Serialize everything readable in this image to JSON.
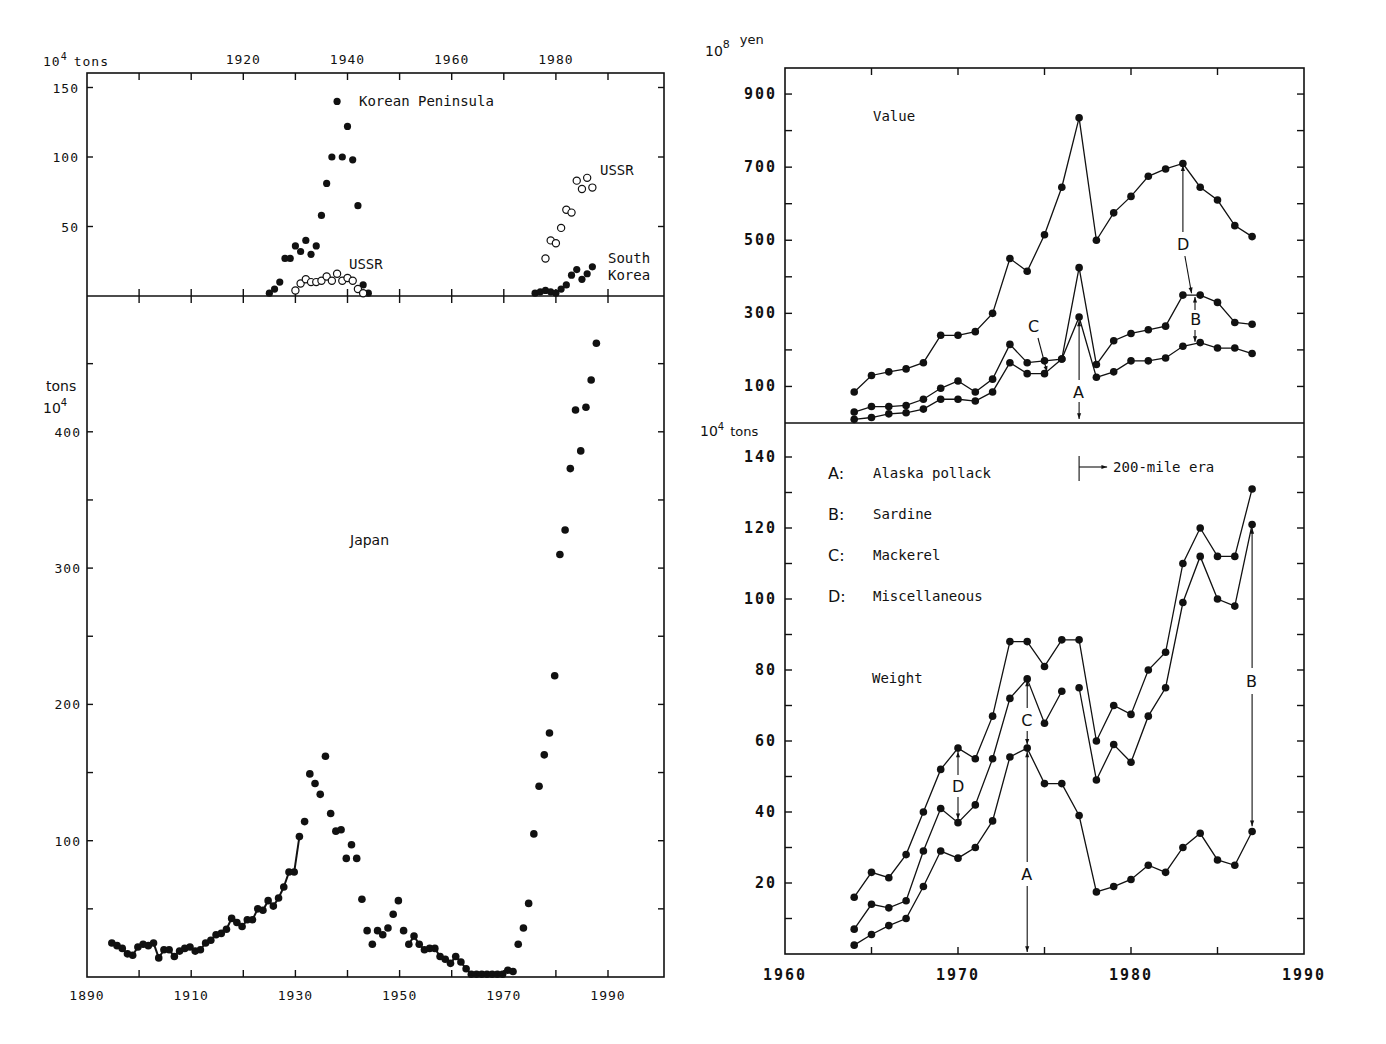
{
  "chart_data": [
    {
      "id": "left-top",
      "type": "scatter",
      "title": "",
      "xlabel": "",
      "ylabel": "10^4 tons",
      "ylabel_base": "10",
      "ylabel_exp": "4",
      "ylabel_unit": "tons",
      "xlim": [
        1890,
        2000
      ],
      "ylim": [
        0,
        160
      ],
      "x_ticks_labeled": [
        1920,
        1940,
        1960,
        1980
      ],
      "x_ticks": [
        1900,
        1910,
        1920,
        1930,
        1940,
        1950,
        1960,
        1970,
        1980,
        1990
      ],
      "y_ticks": [
        50,
        100,
        150
      ],
      "annotations": [
        "Korean Peninsula",
        "USSR",
        "USSR",
        "South Korea"
      ],
      "series": [
        {
          "name": "Korean Peninsula",
          "marker": "filled",
          "x": [
            1925,
            1926,
            1927,
            1928,
            1929,
            1930,
            1931,
            1932,
            1933,
            1934,
            1935,
            1936,
            1937,
            1938,
            1939,
            1940,
            1941,
            1942,
            1943,
            1944
          ],
          "y": [
            2,
            5,
            10,
            27,
            27,
            36,
            32,
            40,
            30,
            36,
            58,
            81,
            100,
            140,
            100,
            122,
            98,
            65,
            8,
            2
          ]
        },
        {
          "name": "USSR (prewar)",
          "marker": "open",
          "x": [
            1930,
            1931,
            1932,
            1933,
            1934,
            1935,
            1936,
            1937,
            1938,
            1939,
            1940,
            1941,
            1942,
            1943
          ],
          "y": [
            4,
            9,
            12,
            10,
            10,
            11,
            14,
            11,
            16,
            11,
            13,
            11,
            5,
            2
          ]
        },
        {
          "name": "USSR",
          "marker": "open",
          "x": [
            1978,
            1979,
            1980,
            1981,
            1982,
            1983,
            1984,
            1985,
            1986,
            1987
          ],
          "y": [
            27,
            40,
            38,
            49,
            62,
            60,
            83,
            77,
            85,
            78
          ]
        },
        {
          "name": "South Korea",
          "marker": "filled",
          "x": [
            1976,
            1977,
            1978,
            1979,
            1980,
            1981,
            1982,
            1983,
            1984,
            1985,
            1986,
            1987
          ],
          "y": [
            2,
            3,
            4,
            3,
            2,
            5,
            8,
            15,
            19,
            12,
            16,
            21
          ]
        }
      ],
      "labels": {
        "korean": "Korean Peninsula",
        "ussr1": "USSR",
        "ussr2": "USSR",
        "south1": "South",
        "south2": "Korea"
      }
    },
    {
      "id": "left-bottom",
      "type": "scatter",
      "title": "Japan",
      "xlabel": "",
      "ylabel": "10^4 tons",
      "ylabel_base": "10",
      "ylabel_exp": "4",
      "ylabel_unit": "tons",
      "xlim": [
        1890,
        2000
      ],
      "ylim": [
        0,
        470
      ],
      "x_ticks_labeled": [
        1890,
        1910,
        1930,
        1950,
        1970,
        1990
      ],
      "y_ticks": [
        100,
        200,
        300,
        400
      ],
      "series": [
        {
          "name": "Japan",
          "marker": "filled",
          "x": [
            1894,
            1895,
            1896,
            1897,
            1898,
            1899,
            1900,
            1901,
            1902,
            1903,
            1904,
            1905,
            1906,
            1907,
            1908,
            1909,
            1910,
            1911,
            1912,
            1913,
            1914,
            1915,
            1916,
            1917,
            1918,
            1919,
            1920,
            1921,
            1922,
            1923,
            1924,
            1925,
            1926,
            1927,
            1928,
            1929,
            1930,
            1931,
            1932,
            1933,
            1934,
            1935,
            1936,
            1937,
            1938,
            1939,
            1940,
            1941,
            1942,
            1943,
            1944,
            1945,
            1946,
            1947,
            1948,
            1949,
            1950,
            1951,
            1952,
            1953,
            1954,
            1955,
            1956,
            1957,
            1958,
            1959,
            1960,
            1961,
            1962,
            1963,
            1964,
            1965,
            1966,
            1967,
            1968,
            1969,
            1970,
            1971,
            1972,
            1973,
            1974,
            1975,
            1976,
            1977,
            1978,
            1979,
            1980,
            1981,
            1982,
            1983,
            1984,
            1985,
            1986,
            1987
          ],
          "y": [
            25,
            23,
            21,
            17,
            16,
            22,
            24,
            23,
            25,
            14,
            20,
            20,
            15,
            19,
            21,
            22,
            19,
            20,
            25,
            27,
            31,
            32,
            35,
            43,
            40,
            37,
            42,
            42,
            50,
            49,
            56,
            52,
            58,
            66,
            77,
            77,
            103,
            114,
            149,
            142,
            134,
            162,
            120,
            107,
            108,
            87,
            97,
            87,
            57,
            34,
            24,
            34,
            31,
            36,
            46,
            56,
            34,
            24,
            30,
            24,
            20,
            21,
            21,
            15,
            13,
            10,
            15,
            11,
            6,
            2,
            2,
            2,
            2,
            2,
            2,
            2,
            5,
            4,
            24,
            36,
            54,
            105,
            140,
            163,
            179,
            221,
            310,
            328,
            373,
            416,
            386,
            418,
            438,
            465
          ]
        }
      ]
    },
    {
      "id": "right-top",
      "type": "line",
      "title": "Value",
      "xlabel": "",
      "ylabel": "10^8 yen",
      "ylabel_base": "10",
      "ylabel_exp": "8",
      "ylabel_unit": "yen",
      "xlim": [
        1960,
        1990
      ],
      "ylim": [
        0,
        970
      ],
      "y_ticks_labeled": [
        100,
        300,
        500,
        700,
        900
      ],
      "y_ticks": [
        100,
        200,
        300,
        400,
        500,
        600,
        700,
        800,
        900
      ],
      "x": [
        1964,
        1965,
        1966,
        1967,
        1968,
        1969,
        1970,
        1971,
        1972,
        1973,
        1974,
        1975,
        1976,
        1977,
        1978,
        1979,
        1980,
        1981,
        1982,
        1983,
        1984,
        1985,
        1986,
        1987
      ],
      "series": [
        {
          "name": "A+B+C+D (total, top of D)",
          "values": [
            85,
            130,
            140,
            148,
            165,
            240,
            240,
            250,
            300,
            450,
            415,
            515,
            645,
            835,
            500,
            575,
            620,
            675,
            695,
            710,
            645,
            610,
            540,
            510
          ]
        },
        {
          "name": "A+B+C (top of C/B)",
          "values": [
            30,
            45,
            45,
            48,
            65,
            95,
            115,
            85,
            120,
            215,
            165,
            170,
            175,
            425,
            160,
            225,
            245,
            255,
            265,
            350,
            350,
            330,
            275,
            270
          ]
        },
        {
          "name": "A (Alaska pollack)",
          "values": [
            10,
            15,
            25,
            28,
            38,
            65,
            65,
            60,
            85,
            165,
            135,
            135,
            175,
            290,
            125,
            140,
            170,
            170,
            178,
            210,
            220,
            205,
            205,
            190
          ]
        }
      ],
      "annotations": [
        {
          "text": "C",
          "x": 1975,
          "note": "Mackerel band"
        },
        {
          "text": "A",
          "x": 1977,
          "note": "Alaska pollack band"
        },
        {
          "text": "D",
          "x": 1983,
          "note": "Miscellaneous band"
        },
        {
          "text": "B",
          "x": 1984,
          "note": "Sardine band"
        }
      ]
    },
    {
      "id": "right-bottom",
      "type": "line",
      "title": "Weight",
      "xlabel": "",
      "ylabel": "10^4 tons",
      "ylabel_base": "10",
      "ylabel_exp": "4",
      "ylabel_unit": "tons",
      "xlim": [
        1960,
        1990
      ],
      "ylim": [
        0,
        150
      ],
      "x_ticks_labeled": [
        1960,
        1970,
        1980,
        1990
      ],
      "y_ticks_labeled": [
        20,
        40,
        60,
        80,
        100,
        120,
        140
      ],
      "y_ticks": [
        10,
        20,
        30,
        40,
        50,
        60,
        70,
        80,
        90,
        100,
        110,
        120,
        130,
        140
      ],
      "x": [
        1964,
        1965,
        1966,
        1967,
        1968,
        1969,
        1970,
        1971,
        1972,
        1973,
        1974,
        1975,
        1976,
        1977,
        1978,
        1979,
        1980,
        1981,
        1982,
        1983,
        1984,
        1985,
        1986,
        1987
      ],
      "series": [
        {
          "name": "Top line (total)",
          "values": [
            16,
            23,
            21.5,
            28,
            40,
            52,
            58,
            55,
            67,
            88,
            88,
            81,
            88.5,
            88.5,
            60,
            70,
            67.5,
            80,
            85,
            110,
            120,
            112,
            112,
            131
          ]
        },
        {
          "name": "Middle line",
          "values": [
            7,
            14,
            13,
            15,
            29,
            41,
            37,
            42,
            55,
            72,
            77.5,
            65,
            74,
            75,
            49,
            59,
            54,
            67,
            75,
            99,
            112,
            100,
            98,
            121
          ],
          "gap_after_index": 12
        },
        {
          "name": "Bottom line",
          "values": [
            2.5,
            5.5,
            8,
            10,
            19,
            29,
            27,
            30,
            37.5,
            55.5,
            58,
            48,
            48,
            39,
            17.5,
            19,
            21,
            25,
            23,
            30,
            34,
            26.5,
            25,
            34.5
          ]
        }
      ],
      "annotations": [
        {
          "text": "D",
          "x": 1970
        },
        {
          "text": "C",
          "x": 1974
        },
        {
          "text": "A",
          "x": 1974
        },
        {
          "text": "B",
          "x": 1987
        },
        {
          "text": "200-mile era",
          "x": 1977,
          "arrow": "right"
        }
      ]
    }
  ],
  "legend": [
    {
      "key": "A",
      "label": "Alaska pollack"
    },
    {
      "key": "B",
      "label": "Sardine"
    },
    {
      "key": "C",
      "label": "Mackerel"
    },
    {
      "key": "D",
      "label": "Miscellaneous"
    }
  ],
  "panel_titles": {
    "japan": "Japan",
    "value": "Value",
    "weight": "Weight"
  },
  "era_label": "200-mile era",
  "colon": ":"
}
